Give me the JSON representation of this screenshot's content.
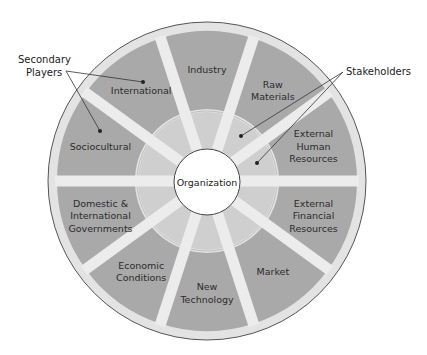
{
  "diagram": {
    "type": "concentric-segmented-wheel",
    "center_label": "Organization",
    "segments": [
      {
        "label_lines": [
          "Industry"
        ],
        "angle_center_deg": 90
      },
      {
        "label_lines": [
          "Raw",
          "Materials"
        ],
        "angle_center_deg": 54
      },
      {
        "label_lines": [
          "External",
          "Human",
          "Resources"
        ],
        "angle_center_deg": 18
      },
      {
        "label_lines": [
          "External",
          "Financial",
          "Resources"
        ],
        "angle_center_deg": -18
      },
      {
        "label_lines": [
          "Market"
        ],
        "angle_center_deg": -54
      },
      {
        "label_lines": [
          "New",
          "Technology"
        ],
        "angle_center_deg": -90
      },
      {
        "label_lines": [
          "Economic",
          "Conditions"
        ],
        "angle_center_deg": -126
      },
      {
        "label_lines": [
          "Domestic &",
          "International",
          "Governments"
        ],
        "angle_center_deg": -162
      },
      {
        "label_lines": [
          "Sociocultural"
        ],
        "angle_center_deg": 162
      },
      {
        "label_lines": [
          "International"
        ],
        "angle_center_deg": 126
      }
    ],
    "callouts": [
      {
        "label_lines": [
          "Secondary",
          "Players"
        ],
        "targets": [
          "International",
          "Sociocultural"
        ]
      },
      {
        "label_lines": [
          "Stakeholders"
        ],
        "targets": [
          "Raw Materials (inner ring)",
          "External Human Resources (inner ring)"
        ]
      }
    ],
    "colors": {
      "outer_ring": "#e3e3e3",
      "outer_segment": "#a9a9a9",
      "inner_ring_segment": "#cfcfcf",
      "spoke": "#ececec",
      "center_fill": "#ffffff",
      "outline": "#555555",
      "text": "#2b2b2b"
    }
  }
}
